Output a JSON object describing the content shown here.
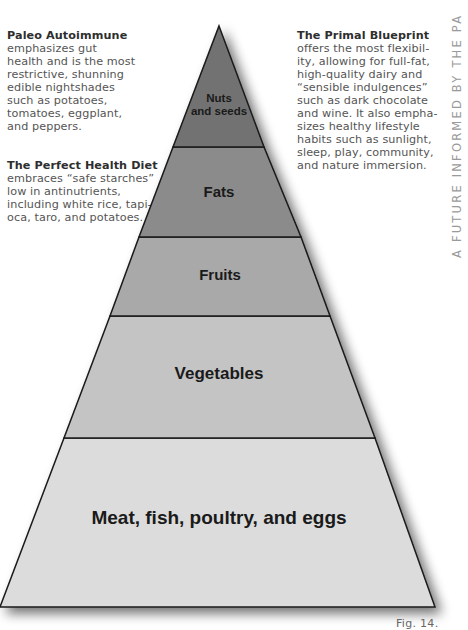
{
  "notes": {
    "paleo": {
      "title": "Paleo Autoimmune",
      "lines": [
        "emphasizes gut",
        "health and is the most",
        "restrictive, shunning",
        "edible nightshades",
        "such as potatoes,",
        "tomatoes, eggplant,",
        "and peppers."
      ]
    },
    "phd": {
      "title": "The Perfect Health Diet",
      "lines": [
        "embraces “safe starches”",
        "low in antinutrients,",
        "including white rice, tapi-",
        "oca, taro, and potatoes."
      ]
    },
    "primal": {
      "title": "The Primal Blueprint",
      "lines": [
        "offers the most flexibil-",
        "ity, allowing for full-fat,",
        "high-quality dairy and",
        "“sensible indulgences”",
        "such as dark chocolate",
        "and wine. It also empha-",
        "sizes healthy lifestyle",
        "habits such as sunlight,",
        "sleep, play, community,",
        "and nature immersion."
      ]
    }
  },
  "side_text": "A FUTURE INFORMED BY THE PA",
  "pyramid": {
    "tiers": [
      {
        "label_line1": "Nuts",
        "label_line2": "and seeds",
        "color": "#727272"
      },
      {
        "label_line1": "Fats",
        "color": "#8b8b8b"
      },
      {
        "label_line1": "Fruits",
        "color": "#a9a9a9"
      },
      {
        "label_line1": "Vegetables",
        "color": "#c4c4c4"
      },
      {
        "label_line1": "Meat, fish, poultry, and eggs",
        "color": "#dcdcdc"
      }
    ]
  },
  "figure_caption": "Fig. 14."
}
